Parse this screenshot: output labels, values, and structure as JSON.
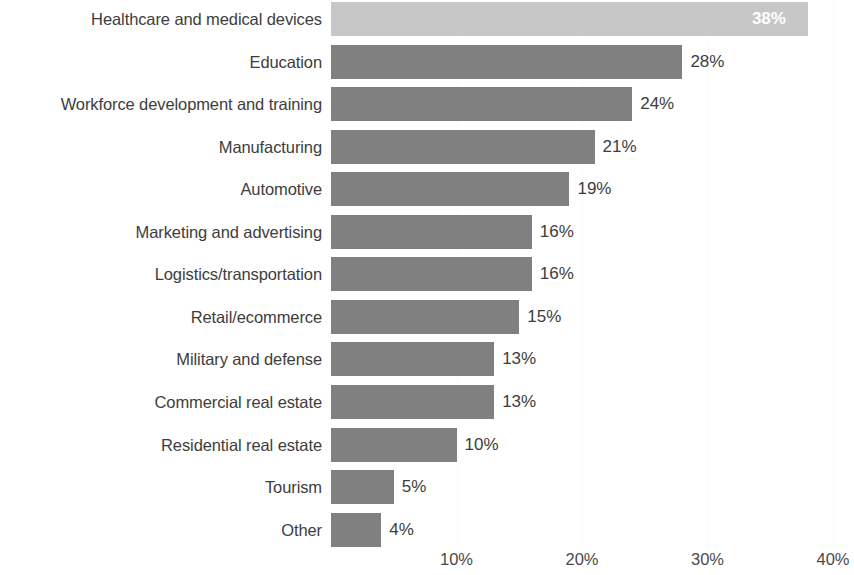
{
  "chart_data": {
    "type": "bar",
    "orientation": "horizontal",
    "title": "",
    "subtitle": "",
    "xlabel": "",
    "ylabel": "",
    "xlim": [
      0,
      40
    ],
    "grid": true,
    "grid_axis": "x",
    "legend": false,
    "value_suffix": "%",
    "categories": [
      "Healthcare and medical devices",
      "Education",
      "Workforce development and training",
      "Manufacturing",
      "Automotive",
      "Marketing and advertising",
      "Logistics/transportation",
      "Retail/ecommerce",
      "Military and defense",
      "Commercial real estate",
      "Residential real estate",
      "Tourism",
      "Other"
    ],
    "values": [
      38,
      28,
      24,
      21,
      19,
      16,
      16,
      15,
      13,
      13,
      10,
      5,
      4
    ],
    "value_labels": [
      "38%",
      "28%",
      "24%",
      "21%",
      "19%",
      "16%",
      "16%",
      "15%",
      "13%",
      "13%",
      "10%",
      "5%",
      "4%"
    ],
    "label_placement": [
      "inside",
      "outside",
      "outside",
      "outside",
      "outside",
      "outside",
      "outside",
      "outside",
      "outside",
      "outside",
      "outside",
      "outside",
      "outside"
    ],
    "bar_colors": [
      "#c7c7c7",
      "#808080",
      "#808080",
      "#808080",
      "#808080",
      "#808080",
      "#808080",
      "#808080",
      "#808080",
      "#808080",
      "#808080",
      "#808080",
      "#808080"
    ],
    "highlight_index": 0,
    "xticks": [
      10,
      20,
      30,
      40
    ],
    "xtick_labels": [
      "10%",
      "20%",
      "30%",
      "40%"
    ],
    "colors": {
      "background": "#ffffff",
      "bar_default": "#808080",
      "bar_highlight": "#c7c7c7",
      "text": "#3d3d3d",
      "gridline": "#fbfbfb",
      "inside_label": "#ffffff"
    }
  }
}
